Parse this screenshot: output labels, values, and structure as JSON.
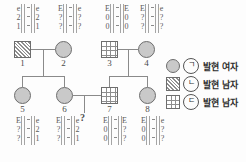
{
  "diagram": {
    "kind": "genetics-pedigree",
    "generations": 2,
    "individuals": [
      {
        "id": "1",
        "number": "1",
        "sex": "male",
        "symbol": "square-diagonal-hatch",
        "generation": 1,
        "genotype": {
          "position": "above",
          "rows": [
            [
              "e",
              "e"
            ],
            [
              "2",
              "2"
            ],
            [
              "1",
              "1"
            ]
          ]
        }
      },
      {
        "id": "2",
        "number": "2",
        "sex": "female",
        "symbol": "circle-filled",
        "generation": 1,
        "genotype": {
          "position": "above",
          "rows": [
            [
              "E",
              "e"
            ],
            [
              "?",
              "?"
            ],
            [
              "?",
              "?"
            ]
          ]
        }
      },
      {
        "id": "3",
        "number": "3",
        "sex": "male",
        "symbol": "square-grid-hatch",
        "generation": 1,
        "genotype": {
          "position": "above",
          "rows": [
            [
              "E",
              "E"
            ],
            [
              "0",
              "0"
            ],
            [
              "0",
              "0"
            ]
          ]
        }
      },
      {
        "id": "4",
        "number": "4",
        "sex": "female",
        "symbol": "circle-filled",
        "generation": 1,
        "genotype": {
          "position": "above",
          "rows": [
            [
              "E",
              "e"
            ],
            [
              "?",
              "?"
            ],
            [
              "?",
              "?"
            ]
          ]
        }
      },
      {
        "id": "5",
        "number": "5",
        "sex": "female",
        "symbol": "circle-filled",
        "generation": 2,
        "genotype": {
          "position": "below",
          "rows": [
            [
              "E",
              "e"
            ],
            [
              "?",
              "2"
            ],
            [
              "?",
              "1"
            ]
          ]
        }
      },
      {
        "id": "6",
        "number": "6",
        "sex": "female",
        "symbol": "circle-filled",
        "generation": 2,
        "genotype": {
          "position": "below",
          "rows": [
            [
              "E",
              "e"
            ],
            [
              "?",
              "2"
            ],
            [
              "?",
              "1"
            ]
          ]
        }
      },
      {
        "id": "7",
        "number": "7",
        "sex": "male",
        "symbol": "square-grid-hatch",
        "generation": 2,
        "genotype": {
          "position": "below",
          "rows": [
            [
              "E",
              "E"
            ],
            [
              "0",
              "?"
            ],
            [
              "0",
              "?"
            ]
          ]
        }
      },
      {
        "id": "8",
        "number": "8",
        "sex": "female",
        "symbol": "circle-filled",
        "generation": 2,
        "genotype": {
          "position": "below",
          "rows": [
            [
              "E",
              "e"
            ],
            [
              "0",
              "?"
            ],
            [
              "0",
              "?"
            ]
          ]
        }
      }
    ],
    "unknown_offspring_marker": "?",
    "separator": "|"
  },
  "legend": {
    "items": [
      {
        "key": "ㄱ",
        "symbol": "circle-filled",
        "label": "발현 여자"
      },
      {
        "key": "ㄴ",
        "symbol": "square-diagonal-hatch",
        "label": "발현 남자"
      },
      {
        "key": "ㄷ",
        "symbol": "square-grid-hatch",
        "label": "발현 남자"
      }
    ]
  }
}
